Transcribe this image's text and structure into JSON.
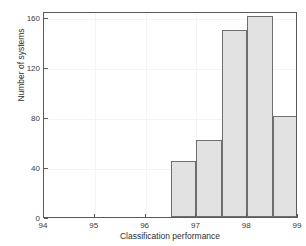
{
  "chart_data": {
    "type": "bar",
    "title": "",
    "xlabel": "Classification performance",
    "ylabel": "Number of systems",
    "xlim": [
      94,
      99
    ],
    "ylim": [
      0,
      165
    ],
    "xticks": [
      94,
      95,
      96,
      97,
      98,
      99
    ],
    "xticklabels": [
      "94",
      "95",
      "96",
      "97",
      "98",
      "99"
    ],
    "yticks": [
      0,
      40,
      80,
      120,
      160
    ],
    "yticklabels": [
      "0",
      "40",
      "80",
      "120",
      "160"
    ],
    "grid": true,
    "legend": null,
    "bin_width": 0.5,
    "bin_edges": [
      96.5,
      97.0,
      97.5,
      98.0,
      98.5,
      99.0
    ],
    "categories": [
      "96.5-97.0",
      "97.0-97.5",
      "97.5-98.0",
      "98.0-98.5",
      "98.5-99.0"
    ],
    "values": [
      45,
      62,
      150,
      161,
      81
    ],
    "bar_color": "#e2e2e2",
    "bar_edge_color": "#6e6e6e",
    "axis_color": "#5a5a5a",
    "grid_color": "#f4f4f4",
    "background_color": "#ffffff"
  }
}
